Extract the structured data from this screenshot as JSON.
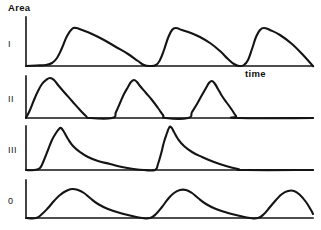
{
  "figure": {
    "background_color": "#ffffff",
    "ink_color": "#141414",
    "width": 321,
    "height": 230,
    "y_axis_label": "Area",
    "x_axis_label": "time"
  },
  "chart_data": {
    "type": "line",
    "title": "",
    "subtitle": "",
    "xlabel": "time",
    "ylabel": "Area",
    "grid": false,
    "legend": null,
    "annotations": [
      {
        "text": "Area",
        "x": 8,
        "y": 11
      },
      {
        "text": "time",
        "x": 245,
        "y": 70
      }
    ],
    "axis_note": "Each panel has a vertical y-axis on the left and a horizontal baseline; no numeric tick labels are printed.",
    "panels": [
      {
        "label": "I",
        "description": "Three cycles: sharp rise, rounded crest, long gradual fall",
        "axis": {
          "x0": 26,
          "baseline_y": 66,
          "top_y": 17,
          "x_end": 313
        },
        "series": [
          {
            "name": "I",
            "points": [
              [
                26,
                66
              ],
              [
                36,
                65.5
              ],
              [
                46,
                65
              ],
              [
                52,
                63
              ],
              [
                57,
                58
              ],
              [
                62,
                48
              ],
              [
                67,
                36
              ],
              [
                72,
                29
              ],
              [
                76,
                28
              ],
              [
                82,
                30
              ],
              [
                92,
                34
              ],
              [
                104,
                40
              ],
              [
                116,
                47
              ],
              [
                128,
                54
              ],
              [
                138,
                61
              ],
              [
                144,
                65
              ],
              [
                150,
                66
              ],
              [
                156,
                65
              ],
              [
                160,
                60
              ],
              [
                164,
                50
              ],
              [
                168,
                38
              ],
              [
                172,
                30
              ],
              [
                176,
                28
              ],
              [
                182,
                30
              ],
              [
                191,
                33
              ],
              [
                200,
                37
              ],
              [
                210,
                43
              ],
              [
                220,
                51
              ],
              [
                228,
                59
              ],
              [
                234,
                64
              ],
              [
                239,
                66
              ],
              [
                244,
                65
              ],
              [
                248,
                60
              ],
              [
                252,
                49
              ],
              [
                256,
                37
              ],
              [
                260,
                30
              ],
              [
                264,
                28
              ],
              [
                270,
                30
              ],
              [
                280,
                35
              ],
              [
                292,
                44
              ],
              [
                304,
                56
              ],
              [
                312,
                65
              ],
              [
                313,
                66
              ]
            ]
          }
        ]
      },
      {
        "label": "II",
        "description": "Three narrow near-symmetric peaks that begin early and return fully to baseline",
        "axis": {
          "x0": 26,
          "baseline_y": 118,
          "top_y": 76,
          "x_end": 313
        },
        "series": [
          {
            "name": "II",
            "points": [
              [
                26,
                118
              ],
              [
                30,
                110
              ],
              [
                34,
                100
              ],
              [
                38,
                91
              ],
              [
                42,
                84
              ],
              [
                46,
                80
              ],
              [
                50,
                78
              ],
              [
                54,
                80
              ],
              [
                58,
                85
              ],
              [
                64,
                92
              ],
              [
                72,
                101
              ],
              [
                80,
                110
              ],
              [
                86,
                116
              ],
              [
                90,
                118
              ],
              [
                112,
                118
              ],
              [
                116,
                112
              ],
              [
                120,
                103
              ],
              [
                124,
                94
              ],
              [
                128,
                87
              ],
              [
                131,
                82
              ],
              [
                134,
                80
              ],
              [
                137,
                82
              ],
              [
                140,
                86
              ],
              [
                146,
                93
              ],
              [
                152,
                100
              ],
              [
                158,
                108
              ],
              [
                163,
                115
              ],
              [
                166,
                118
              ],
              [
                188,
                118
              ],
              [
                192,
                112
              ],
              [
                197,
                104
              ],
              [
                202,
                95
              ],
              [
                206,
                88
              ],
              [
                209,
                83
              ],
              [
                212,
                81
              ],
              [
                215,
                84
              ],
              [
                218,
                89
              ],
              [
                222,
                96
              ],
              [
                227,
                103
              ],
              [
                232,
                110
              ],
              [
                236,
                116
              ],
              [
                239,
                118
              ],
              [
                313,
                118
              ]
            ]
          }
        ]
      },
      {
        "label": "III",
        "description": "Two cycles: very sharp rise to a pointed peak then slow exponential decay to baseline",
        "axis": {
          "x0": 26,
          "baseline_y": 170,
          "top_y": 126,
          "x_end": 313
        },
        "series": [
          {
            "name": "III",
            "points": [
              [
                26,
                170
              ],
              [
                34,
                170
              ],
              [
                40,
                168
              ],
              [
                44,
                160
              ],
              [
                48,
                150
              ],
              [
                52,
                140
              ],
              [
                56,
                133
              ],
              [
                59,
                129
              ],
              [
                61,
                128
              ],
              [
                64,
                132
              ],
              [
                68,
                139
              ],
              [
                73,
                146
              ],
              [
                80,
                152
              ],
              [
                88,
                157
              ],
              [
                98,
                161
              ],
              [
                110,
                164
              ],
              [
                122,
                167
              ],
              [
                134,
                169
              ],
              [
                144,
                170
              ],
              [
                155,
                170
              ],
              [
                158,
                164
              ],
              [
                161,
                154
              ],
              [
                164,
                142
              ],
              [
                167,
                133
              ],
              [
                169,
                128
              ],
              [
                171,
                127
              ],
              [
                174,
                132
              ],
              [
                178,
                139
              ],
              [
                184,
                146
              ],
              [
                192,
                152
              ],
              [
                202,
                157
              ],
              [
                214,
                162
              ],
              [
                226,
                166
              ],
              [
                238,
                169
              ],
              [
                246,
                170
              ],
              [
                313,
                170
              ]
            ]
          }
        ]
      },
      {
        "label": "0",
        "description": "Three broad, smooth, rounded humps with gentle rise and fall",
        "axis": {
          "x0": 26,
          "baseline_y": 218,
          "top_y": 180,
          "x_end": 313
        },
        "series": [
          {
            "name": "0",
            "points": [
              [
                26,
                218
              ],
              [
                36,
                218
              ],
              [
                42,
                214
              ],
              [
                48,
                208
              ],
              [
                54,
                201
              ],
              [
                60,
                195
              ],
              [
                66,
                191
              ],
              [
                72,
                189
              ],
              [
                78,
                190
              ],
              [
                84,
                193
              ],
              [
                90,
                198
              ],
              [
                98,
                204
              ],
              [
                108,
                209
              ],
              [
                120,
                213
              ],
              [
                132,
                216
              ],
              [
                142,
                218
              ],
              [
                150,
                218
              ],
              [
                156,
                214
              ],
              [
                162,
                207
              ],
              [
                168,
                199
              ],
              [
                174,
                193
              ],
              [
                180,
                190
              ],
              [
                186,
                190
              ],
              [
                192,
                193
              ],
              [
                198,
                198
              ],
              [
                206,
                204
              ],
              [
                216,
                209
              ],
              [
                228,
                213
              ],
              [
                240,
                216
              ],
              [
                250,
                218
              ],
              [
                258,
                218
              ],
              [
                264,
                214
              ],
              [
                270,
                207
              ],
              [
                276,
                200
              ],
              [
                282,
                194
              ],
              [
                288,
                191
              ],
              [
                294,
                191
              ],
              [
                300,
                195
              ],
              [
                306,
                202
              ],
              [
                311,
                210
              ],
              [
                313,
                214
              ]
            ]
          }
        ]
      }
    ]
  }
}
